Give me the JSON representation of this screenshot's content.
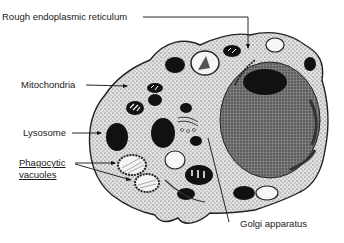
{
  "diagram": {
    "labels": {
      "rer": "Rough endoplasmic reticulum",
      "mitochondria": "Mitochondria",
      "lysosome": "Lysosome",
      "phagocytic_line1": "Phagocytic",
      "phagocytic_line2": "vacuoles",
      "golgi": "Golgi apparatus"
    },
    "structures": [
      "cell-membrane",
      "cytoplasm",
      "nucleus",
      "nucleolus",
      "mitochondria",
      "lysosomes",
      "phagocytic-vacuoles",
      "golgi-apparatus",
      "rough-endoplasmic-reticulum"
    ],
    "colors": {
      "ink": "#111111",
      "cytoplasm": "#d8d8d8",
      "nucleus": "#6a6a6a",
      "background": "#ffffff"
    }
  }
}
